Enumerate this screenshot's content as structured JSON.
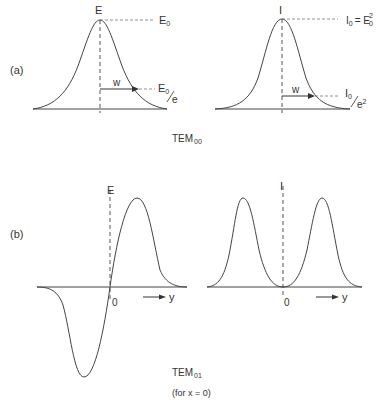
{
  "panel_a": {
    "label": "(a)",
    "left": {
      "axis_label": "E",
      "peak_label": "E",
      "peak_sub": "0",
      "width_label": "w",
      "width_value_num": "E",
      "width_value_sub": "0",
      "width_value_den": "e"
    },
    "right": {
      "axis_label": "I",
      "peak_label_I": "I",
      "peak_label_I_sub": "0",
      "peak_label_eq": "= E",
      "peak_label_E_sub": "0",
      "peak_label_E_sup": "2",
      "width_label": "w",
      "width_value_num": "I",
      "width_value_sub": "0",
      "width_value_den": "e",
      "width_value_den_sup": "2"
    },
    "caption_main": "TEM",
    "caption_sub": "00"
  },
  "panel_b": {
    "label": "(b)",
    "left": {
      "axis_label": "E",
      "origin": "0",
      "axis_var": "y"
    },
    "right": {
      "axis_label": "I",
      "origin": "0",
      "axis_var": "y"
    },
    "caption_main": "TEM",
    "caption_sub": "01",
    "caption_note": "(for x = 0)"
  },
  "colors": {
    "line": "#444444",
    "dash": "#666666",
    "text": "#333333"
  }
}
